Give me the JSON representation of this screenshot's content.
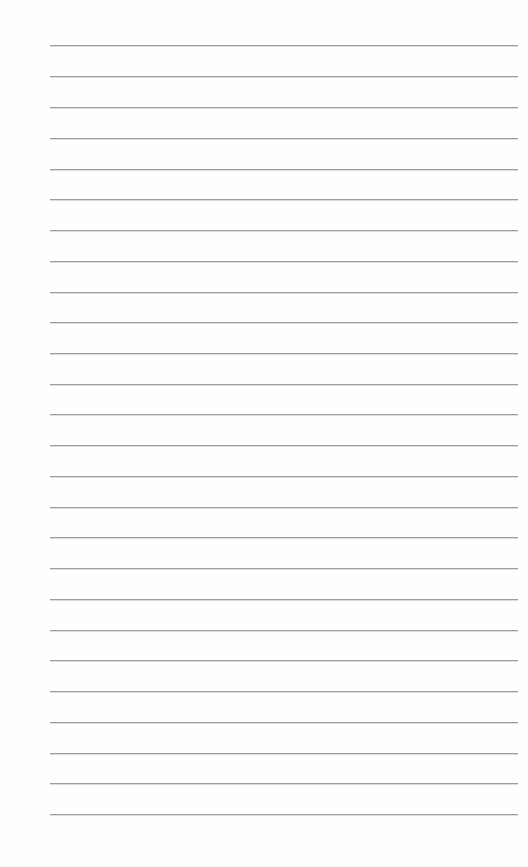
{
  "document": {
    "type": "lined-paper",
    "background_color": "#fefefe",
    "rule_color": "#9c9c9c",
    "rule_count": 26,
    "rules_y": [
      45,
      76,
      107,
      138,
      169,
      199,
      230,
      261,
      292,
      322,
      353,
      384,
      414,
      445,
      476,
      507,
      537,
      568,
      599,
      630,
      660,
      691,
      722,
      753,
      783,
      814
    ],
    "rule_x_start": 50,
    "rule_x_end": 518
  }
}
